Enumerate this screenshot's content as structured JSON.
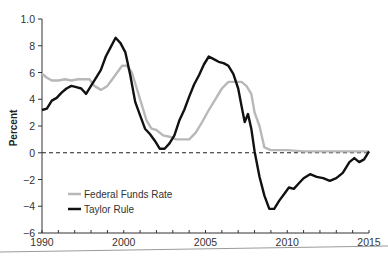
{
  "chart_data": {
    "type": "line",
    "title": "",
    "xlabel": "",
    "ylabel": "Percent",
    "xlim": [
      1995,
      2015
    ],
    "ylim": [
      -6,
      10
    ],
    "grid": false,
    "legend_position": "lower-left inside",
    "y_ticks": [
      {
        "value": 10,
        "label": "1.0"
      },
      {
        "value": 8,
        "label": "8"
      },
      {
        "value": 6,
        "label": "6"
      },
      {
        "value": 4,
        "label": "4"
      },
      {
        "value": 2,
        "label": "2"
      },
      {
        "value": 0,
        "label": "0"
      },
      {
        "value": -2,
        "label": "−2"
      },
      {
        "value": -4,
        "label": "−4"
      },
      {
        "value": -6,
        "label": "−6"
      }
    ],
    "x_ticks": [
      {
        "value": 1995,
        "label": "1990"
      },
      {
        "value": 2000,
        "label": "2000"
      },
      {
        "value": 2005,
        "label": "2005"
      },
      {
        "value": 2010,
        "label": "2010"
      },
      {
        "value": 2015,
        "label": "2015"
      }
    ],
    "minor_x_tick_step": 1,
    "reference_line": {
      "y": 0,
      "style": "dashed",
      "color": "#222222"
    },
    "series": [
      {
        "name": "Federal Funds Rate",
        "color": "#b8b8b8",
        "x": [
          1995.0,
          1995.3,
          1995.6,
          1996.0,
          1996.4,
          1996.8,
          1997.2,
          1997.6,
          1997.9,
          1998.2,
          1998.6,
          1999.0,
          1999.3,
          1999.6,
          1999.9,
          2000.2,
          2000.5,
          2000.8,
          2001.1,
          2001.4,
          2001.7,
          2002.0,
          2002.4,
          2002.8,
          2003.2,
          2003.6,
          2004.0,
          2004.4,
          2004.8,
          2005.2,
          2005.6,
          2006.0,
          2006.4,
          2006.8,
          2007.2,
          2007.5,
          2007.8,
          2008.0,
          2008.3,
          2008.6,
          2009.0,
          2010.0,
          2011.0,
          2012.0,
          2013.0,
          2014.0,
          2015.0
        ],
        "values": [
          5.9,
          5.6,
          5.4,
          5.4,
          5.5,
          5.4,
          5.5,
          5.5,
          5.5,
          5.0,
          4.7,
          5.0,
          5.5,
          6.0,
          6.5,
          6.5,
          6.0,
          4.8,
          3.6,
          2.4,
          1.8,
          1.7,
          1.3,
          1.2,
          1.0,
          1.0,
          1.0,
          1.5,
          2.3,
          3.2,
          4.0,
          4.8,
          5.3,
          5.3,
          5.3,
          5.0,
          4.4,
          3.0,
          2.0,
          0.4,
          0.2,
          0.2,
          0.1,
          0.1,
          0.1,
          0.1,
          0.1
        ]
      },
      {
        "name": "Taylor Rule",
        "color": "#111111",
        "x": [
          1995.0,
          1995.3,
          1995.6,
          1995.9,
          1996.2,
          1996.5,
          1996.8,
          1997.1,
          1997.4,
          1997.7,
          1998.0,
          1998.3,
          1998.6,
          1998.9,
          1999.2,
          1999.5,
          1999.8,
          2000.1,
          2000.4,
          2000.7,
          2001.0,
          2001.3,
          2001.6,
          2001.9,
          2002.2,
          2002.5,
          2002.8,
          2003.1,
          2003.4,
          2003.7,
          2004.0,
          2004.3,
          2004.6,
          2004.9,
          2005.2,
          2005.5,
          2005.8,
          2006.1,
          2006.4,
          2006.7,
          2007.0,
          2007.2,
          2007.4,
          2007.6,
          2007.8,
          2008.0,
          2008.3,
          2008.6,
          2008.9,
          2009.2,
          2009.5,
          2009.8,
          2010.1,
          2010.4,
          2010.7,
          2011.0,
          2011.4,
          2011.8,
          2012.2,
          2012.6,
          2013.0,
          2013.4,
          2013.8,
          2014.1,
          2014.4,
          2014.7,
          2015.0
        ],
        "values": [
          3.2,
          3.3,
          3.9,
          4.1,
          4.5,
          4.8,
          5.0,
          4.9,
          4.8,
          4.4,
          5.0,
          5.6,
          6.2,
          7.2,
          7.9,
          8.6,
          8.2,
          7.5,
          5.8,
          3.8,
          2.8,
          1.8,
          1.4,
          0.9,
          0.3,
          0.3,
          0.7,
          1.3,
          2.4,
          3.2,
          4.2,
          5.1,
          5.8,
          6.6,
          7.2,
          7.0,
          6.8,
          6.7,
          6.5,
          5.9,
          4.8,
          3.5,
          2.3,
          2.9,
          1.8,
          0.1,
          -1.8,
          -3.2,
          -4.2,
          -4.2,
          -3.6,
          -3.1,
          -2.6,
          -2.7,
          -2.3,
          -1.9,
          -1.6,
          -1.8,
          -1.9,
          -2.1,
          -1.9,
          -1.5,
          -0.7,
          -0.4,
          -0.7,
          -0.5,
          0.1
        ]
      }
    ]
  }
}
